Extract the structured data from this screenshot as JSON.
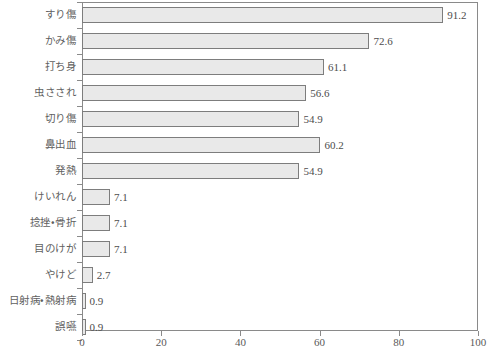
{
  "chart_data": {
    "type": "bar",
    "orientation": "horizontal",
    "title": "",
    "subtitle": "",
    "xlabel": "",
    "ylabel": "",
    "xlim": [
      0,
      100
    ],
    "xticks": [
      0,
      20,
      40,
      60,
      80,
      100
    ],
    "grid": false,
    "legend": null,
    "bar_fill_color": "#e9e9e9",
    "bar_border_color": "#7d7d7d",
    "axis_color": "#8a8a8a",
    "text_color": "#5a5a5a",
    "categories": [
      "すり傷",
      "かみ傷",
      "打ち身",
      "虫さされ",
      "切り傷",
      "鼻出血",
      "発熱",
      "けいれん",
      "捻挫・骨折",
      "目のけが",
      "やけど",
      "日射病・熱射病",
      "誤嚥"
    ],
    "values": [
      91.2,
      72.6,
      61.1,
      56.6,
      54.9,
      60.2,
      54.9,
      7.1,
      7.1,
      7.1,
      2.7,
      0.9,
      0.9
    ],
    "value_labels": [
      "91.2",
      "72.6",
      "61.1",
      "56.6",
      "54.9",
      "60.2",
      "54.9",
      "7.1",
      "7.1",
      "7.1",
      "2.7",
      "0.9",
      "0.9"
    ],
    "tick_labels": [
      "0",
      "20",
      "40",
      "60",
      "80",
      "100"
    ]
  }
}
